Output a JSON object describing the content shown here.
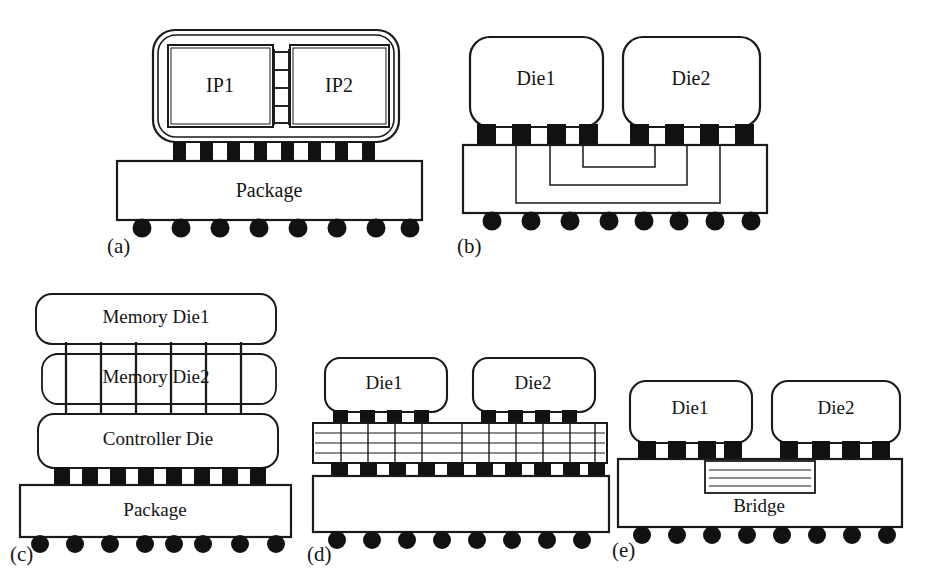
{
  "figure": {
    "background_color": "#ffffff",
    "line_color": "#1a1a1a",
    "fill_color": "#ffffff",
    "bump_color": "#111111",
    "ball_color": "#111111",
    "width": 929,
    "height": 584
  },
  "panels": [
    {
      "id": "a",
      "label": "(a)",
      "caption": "Monolithic SoC with on-die IP block interconnect",
      "blocks": [
        {
          "name": "ip1",
          "label": "IP1"
        },
        {
          "name": "ip2",
          "label": "IP2"
        },
        {
          "name": "package",
          "label": "Package"
        }
      ],
      "interconnect": {
        "type": "ladder",
        "rungs": 4,
        "rails": 2
      },
      "microbump_count": 8,
      "solder_ball_count": 8
    },
    {
      "id": "b",
      "label": "(b)",
      "caption": "Multi-chip module with organic substrate routing",
      "blocks": [
        {
          "name": "die1",
          "label": "Die1"
        },
        {
          "name": "die2",
          "label": "Die2"
        }
      ],
      "interconnect": {
        "type": "nested-u-traces",
        "trace_count": 3
      },
      "microbump_count_per_die": 4,
      "solder_ball_count": 8
    },
    {
      "id": "c",
      "label": "(c)",
      "caption": "3D stacked memory on controller die with through-silicon vias",
      "blocks": [
        {
          "name": "memory-die-1",
          "label": "Memory Die1"
        },
        {
          "name": "memory-die-2",
          "label": "Memory Die2"
        },
        {
          "name": "controller-die",
          "label": "Controller Die"
        },
        {
          "name": "package",
          "label": "Package"
        }
      ],
      "interconnect": {
        "type": "tsv",
        "via_count": 6
      },
      "microbump_count": 8,
      "solder_ball_count": 8
    },
    {
      "id": "d",
      "label": "(d)",
      "caption": "2.5D integration on silicon interposer",
      "blocks": [
        {
          "name": "die1",
          "label": "Die1"
        },
        {
          "name": "die2",
          "label": "Die2"
        },
        {
          "name": "interposer",
          "label": ""
        },
        {
          "name": "package",
          "label": ""
        }
      ],
      "interconnect": {
        "type": "interposer",
        "routing_lines": 3,
        "via_count": 10
      },
      "microbump_count_per_die": 4,
      "interposer_bump_count": 10,
      "solder_ball_count": 8
    },
    {
      "id": "e",
      "label": "(e)",
      "caption": "Embedded silicon bridge in package substrate",
      "blocks": [
        {
          "name": "die1",
          "label": "Die1"
        },
        {
          "name": "die2",
          "label": "Die2"
        },
        {
          "name": "bridge",
          "label": "Bridge"
        }
      ],
      "interconnect": {
        "type": "embedded-bridge",
        "routing_lines": 3
      },
      "microbump_count_per_die": 4,
      "solder_ball_count": 8
    }
  ]
}
